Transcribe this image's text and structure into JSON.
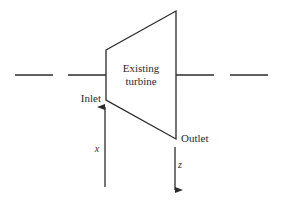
{
  "diagram": {
    "turbine_label_line1": "Existing",
    "turbine_label_line2": "turbine",
    "inlet_label": "Inlet",
    "outlet_label": "Outlet",
    "inlet_variable": "x",
    "outlet_variable": "z",
    "stroke_color": "#2a2a2a",
    "background": "#ffffff"
  }
}
